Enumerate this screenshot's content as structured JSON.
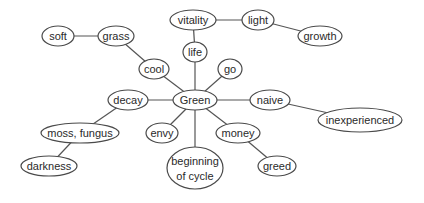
{
  "diagram": {
    "type": "concept-map",
    "center": "Green",
    "colors": {
      "stroke": "#4a4a4a",
      "text": "#2a2a2a",
      "background": "#ffffff"
    },
    "nodes": [
      {
        "id": "soft",
        "label": "soft",
        "x": 58,
        "y": 36,
        "rx": 16,
        "ry": 10
      },
      {
        "id": "grass",
        "label": "grass",
        "x": 116,
        "y": 36,
        "rx": 18,
        "ry": 10
      },
      {
        "id": "cool",
        "label": "cool",
        "x": 154,
        "y": 69,
        "rx": 15,
        "ry": 10
      },
      {
        "id": "vitality",
        "label": "vitality",
        "x": 193,
        "y": 20,
        "rx": 23,
        "ry": 10
      },
      {
        "id": "light",
        "label": "light",
        "x": 258,
        "y": 20,
        "rx": 16,
        "ry": 10
      },
      {
        "id": "growth",
        "label": "growth",
        "x": 320,
        "y": 36,
        "rx": 22,
        "ry": 10
      },
      {
        "id": "life",
        "label": "life",
        "x": 195,
        "y": 52,
        "rx": 12,
        "ry": 10
      },
      {
        "id": "go",
        "label": "go",
        "x": 230,
        "y": 69,
        "rx": 12,
        "ry": 10
      },
      {
        "id": "green",
        "label": "Green",
        "x": 195,
        "y": 100,
        "rx": 22,
        "ry": 10
      },
      {
        "id": "decay",
        "label": "decay",
        "x": 128,
        "y": 100,
        "rx": 20,
        "ry": 10
      },
      {
        "id": "naive",
        "label": "naive",
        "x": 270,
        "y": 100,
        "rx": 20,
        "ry": 10
      },
      {
        "id": "inexperienced",
        "label": "inexperienced",
        "x": 360,
        "y": 120,
        "rx": 42,
        "ry": 12
      },
      {
        "id": "moss-fungus",
        "label": "moss, fungus",
        "x": 80,
        "y": 133,
        "rx": 39,
        "ry": 10
      },
      {
        "id": "envy",
        "label": "envy",
        "x": 162,
        "y": 133,
        "rx": 16,
        "ry": 10
      },
      {
        "id": "money",
        "label": "money",
        "x": 238,
        "y": 133,
        "rx": 22,
        "ry": 10
      },
      {
        "id": "darkness",
        "label": "darkness",
        "x": 49,
        "y": 166,
        "rx": 28,
        "ry": 10
      },
      {
        "id": "beginning-of-cycle",
        "label": "beginning",
        "label2": "of cycle",
        "x": 195,
        "y": 168,
        "rx": 28,
        "ry": 21
      },
      {
        "id": "greed",
        "label": "greed",
        "x": 277,
        "y": 166,
        "rx": 19,
        "ry": 10
      }
    ],
    "edges": [
      [
        "soft",
        "grass"
      ],
      [
        "grass",
        "cool"
      ],
      [
        "cool",
        "green"
      ],
      [
        "vitality",
        "light"
      ],
      [
        "light",
        "growth"
      ],
      [
        "vitality",
        "life"
      ],
      [
        "life",
        "green"
      ],
      [
        "go",
        "green"
      ],
      [
        "decay",
        "green"
      ],
      [
        "green",
        "naive"
      ],
      [
        "naive",
        "inexperienced"
      ],
      [
        "decay",
        "moss-fungus"
      ],
      [
        "moss-fungus",
        "darkness"
      ],
      [
        "green",
        "envy"
      ],
      [
        "green",
        "money"
      ],
      [
        "money",
        "greed"
      ],
      [
        "green",
        "beginning-of-cycle"
      ]
    ]
  }
}
